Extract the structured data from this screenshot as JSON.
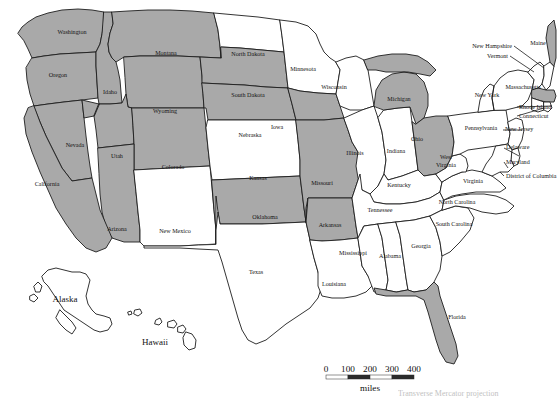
{
  "map": {
    "title": "United States choropleth map",
    "background_color": "#ffffff",
    "shaded_fill": "#a9a9a9",
    "plain_fill": "#ffffff",
    "border_color": "#1d1d1d",
    "shaded_states": [
      "Washington",
      "Oregon",
      "Idaho",
      "Montana",
      "Wyoming",
      "Nevada",
      "Utah",
      "Colorado",
      "Arizona",
      "South Dakota",
      "Nebraska",
      "Iowa",
      "Missouri",
      "Oklahoma",
      "Arkansas",
      "Michigan",
      "Ohio",
      "Maine",
      "Massachusetts",
      "Florida"
    ],
    "plain_states": [
      "North Dakota",
      "Minnesota",
      "Wisconsin",
      "Illinois",
      "Indiana",
      "Kansas",
      "New Mexico",
      "Texas",
      "Louisiana",
      "Mississippi",
      "Alabama",
      "Georgia",
      "Tennessee",
      "Kentucky",
      "North Carolina",
      "South Carolina",
      "Virginia",
      "West Virginia",
      "Pennsylvania",
      "New York",
      "New Jersey",
      "Delaware",
      "Maryland",
      "Vermont",
      "New Hampshire",
      "Connecticut",
      "Rhode Island",
      "District of Columbia",
      "Alaska",
      "Hawaii"
    ],
    "labels": {
      "washington": "Washington",
      "oregon": "Oregon",
      "idaho": "Idaho",
      "montana": "Montana",
      "wyoming": "Wyoming",
      "nevada": "Nevada",
      "utah": "Utah",
      "colorado": "Colorado",
      "arizona": "Arizona",
      "california": "California",
      "new_mexico": "New Mexico",
      "north_dakota": "North Dakota",
      "south_dakota": "South Dakota",
      "nebraska": "Nebraska",
      "kansas": "Kansas",
      "oklahoma": "Oklahoma",
      "texas": "Texas",
      "minnesota": "Minnesota",
      "iowa": "Iowa",
      "missouri": "Missouri",
      "arkansas": "Arkansas",
      "louisiana": "Louisiana",
      "wisconsin": "Wisconsin",
      "illinois": "Illinois",
      "indiana": "Indiana",
      "michigan": "Michigan",
      "ohio": "Ohio",
      "kentucky": "Kentucky",
      "tennessee": "Tennessee",
      "mississippi": "Mississippi",
      "alabama": "Alabama",
      "georgia": "Georgia",
      "florida": "Florida",
      "south_carolina": "South Carolina",
      "north_carolina": "North Carolina",
      "virginia": "Virginia",
      "west_virginia_line1": "West",
      "west_virginia_line2": "Virginia",
      "maryland": "Maryland",
      "delaware": "Delaware",
      "district_of_columbia": "District of Columbia",
      "pennsylvania": "Pennsylvania",
      "new_jersey": "New Jersey",
      "new_york": "New York",
      "connecticut": "Connecticut",
      "rhode_island": "Rhode Island",
      "massachusetts": "Massachusetts",
      "vermont": "Vermont",
      "new_hampshire": "New Hampshire",
      "maine": "Maine",
      "alaska": "Alaska",
      "hawaii": "Hawaii"
    }
  },
  "scale_bar": {
    "ticks": [
      "0",
      "100",
      "200",
      "300",
      "400"
    ],
    "unit_label": "miles"
  },
  "footnote": {
    "text": "Transverse Mercator projection"
  }
}
